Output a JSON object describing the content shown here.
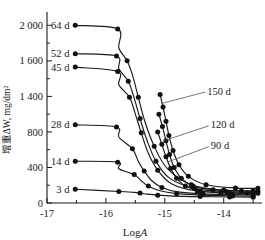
{
  "chart_data": {
    "type": "line",
    "title": "",
    "xlabel": "LogA",
    "ylabel": "增重ΔW, mg/dm²",
    "xlim": [
      -17.0,
      -13.35
    ],
    "ylim": [
      0,
      2150
    ],
    "grid": false,
    "legend_position": "inline-labels",
    "xticks": [
      -17,
      -16,
      -15,
      -14
    ],
    "xtick_labels": [
      "-17",
      "-16",
      "-15",
      "-14"
    ],
    "yticks": [
      0,
      400,
      800,
      1200,
      1600,
      2000
    ],
    "ytick_labels": [
      "0",
      "400",
      "800",
      "1 400",
      "1 600",
      "2 000"
    ],
    "yminor": [
      200,
      600,
      1000,
      1400,
      1800
    ],
    "series": [
      {
        "name": "3 d",
        "label_side": "left",
        "x": [
          -16.52,
          -15.78,
          -15.52,
          -15.42,
          -15.3,
          -15.12,
          -14.85,
          -14.4,
          -13.9,
          -13.5
        ],
        "y": [
          155,
          130,
          120,
          112,
          100,
          88,
          78,
          72,
          68,
          66
        ]
      },
      {
        "name": "14 d",
        "label_side": "left",
        "x": [
          -16.52,
          -15.8,
          -15.78,
          -15.52,
          -15.4,
          -15.28,
          -15.1,
          -14.8,
          -14.35,
          -13.85,
          -13.5
        ],
        "y": [
          470,
          460,
          385,
          320,
          250,
          190,
          140,
          105,
          88,
          80,
          78
        ]
      },
      {
        "name": "28 d",
        "label_side": "left",
        "x": [
          -16.52,
          -15.82,
          -15.78,
          -15.55,
          -15.45,
          -15.35,
          -15.22,
          -15.05,
          -14.78,
          -14.35,
          -13.85,
          -13.5
        ],
        "y": [
          880,
          855,
          740,
          610,
          470,
          360,
          250,
          175,
          125,
          102,
          95,
          92
        ]
      },
      {
        "name": "45 d",
        "label_side": "left",
        "x": [
          -16.52,
          -15.8,
          -15.78,
          -15.6,
          -15.5,
          -15.4,
          -15.28,
          -15.12,
          -14.88,
          -14.45,
          -13.9,
          -13.5
        ],
        "y": [
          1530,
          1480,
          1330,
          1190,
          1000,
          790,
          560,
          370,
          215,
          135,
          112,
          108
        ]
      },
      {
        "name": "52 d",
        "label_side": "left",
        "x": [
          -16.52,
          -15.82,
          -15.78,
          -15.62,
          -15.52,
          -15.42,
          -15.3,
          -15.15,
          -14.92,
          -14.5,
          -13.95,
          -13.5
        ],
        "y": [
          1680,
          1655,
          1510,
          1370,
          1180,
          950,
          700,
          470,
          280,
          165,
          128,
          122
        ]
      },
      {
        "name": "64 d",
        "label_side": "left",
        "x": [
          -16.52,
          -15.8,
          -15.78,
          -15.64,
          -15.54,
          -15.45,
          -15.34,
          -15.18,
          -14.96,
          -14.55,
          -14.0,
          -13.5
        ],
        "y": [
          2000,
          1960,
          1745,
          1600,
          1420,
          1190,
          920,
          640,
          390,
          205,
          145,
          138
        ]
      },
      {
        "name": "90 d",
        "label_side": "right",
        "x": [
          -15.12,
          -15.05,
          -14.98,
          -14.9,
          -14.8,
          -14.65,
          -14.4,
          -14.05,
          -13.6,
          -13.42
        ],
        "y": [
          800,
          660,
          520,
          390,
          280,
          190,
          135,
          118,
          112,
          110
        ]
      },
      {
        "name": "120 d",
        "label_side": "right",
        "x": [
          -15.1,
          -15.04,
          -14.98,
          -14.92,
          -14.84,
          -14.72,
          -14.52,
          -14.18,
          -13.7,
          -13.42
        ],
        "y": [
          1000,
          860,
          700,
          545,
          400,
          280,
          190,
          150,
          135,
          132
        ]
      },
      {
        "name": "150 d",
        "label_side": "right",
        "x": [
          -15.08,
          -15.03,
          -14.98,
          -14.93,
          -14.86,
          -14.76,
          -14.6,
          -14.3,
          -13.8,
          -13.42
        ],
        "y": [
          1220,
          1080,
          920,
          760,
          590,
          430,
          300,
          205,
          168,
          165
        ]
      }
    ],
    "inline_labels": [
      {
        "text": "64 d",
        "x": -16.62,
        "y": 2000
      },
      {
        "text": "52 d",
        "x": -16.62,
        "y": 1680
      },
      {
        "text": "45 d",
        "x": -16.62,
        "y": 1530
      },
      {
        "text": "28 d",
        "x": -16.62,
        "y": 880
      },
      {
        "text": "14 d",
        "x": -16.62,
        "y": 470
      },
      {
        "text": "3 d",
        "x": -16.62,
        "y": 155
      }
    ],
    "callouts": [
      {
        "text": "150 d",
        "text_x": -14.28,
        "text_y": 1260,
        "anchor_x": -15.06,
        "anchor_y": 1120
      },
      {
        "text": "120 d",
        "text_x": -14.22,
        "text_y": 880,
        "anchor_x": -15.02,
        "anchor_y": 700
      },
      {
        "text": "90 d",
        "text_x": -14.22,
        "text_y": 645,
        "anchor_x": -14.96,
        "anchor_y": 460
      }
    ]
  }
}
